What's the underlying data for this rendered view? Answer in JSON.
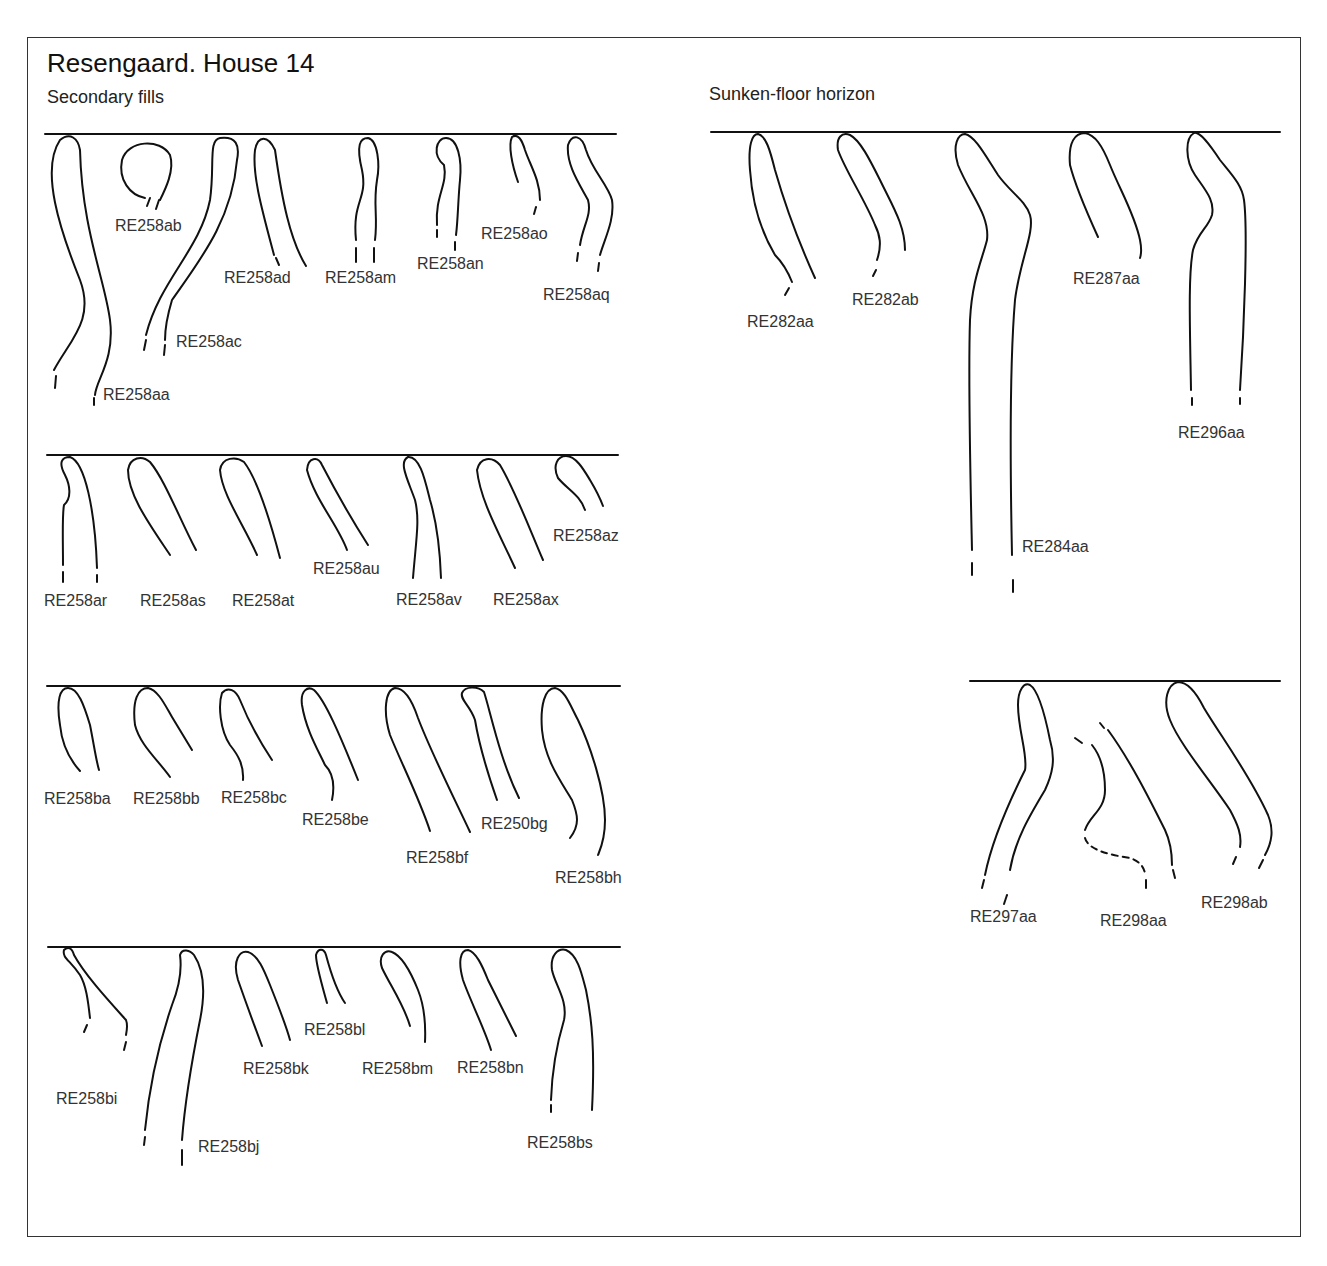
{
  "figure": {
    "title": "Resengaard. House 14",
    "left_panel_subtitle": "Secondary fills",
    "right_panel_subtitle": "Sunken-floor horizon"
  },
  "secondary_fills": {
    "row1": [
      "RE258aa",
      "RE258ab",
      "RE258ac",
      "RE258ad",
      "RE258am",
      "RE258an",
      "RE258ao",
      "RE258aq"
    ],
    "row2": [
      "RE258ar",
      "RE258as",
      "RE258at",
      "RE258au",
      "RE258av",
      "RE258ax",
      "RE258az"
    ],
    "row3": [
      "RE258ba",
      "RE258bb",
      "RE258bc",
      "RE258be",
      "RE258bf",
      "RE258bg",
      "RE258bh"
    ],
    "row4": [
      "RE258bi",
      "RE258bj",
      "RE258bk",
      "RE258bl",
      "RE258bm",
      "RE258bn",
      "RE258bs"
    ]
  },
  "sunken_floor": {
    "row1": [
      "RE282aa",
      "RE282ab",
      "RE284aa",
      "RE287aa",
      "RE296aa"
    ],
    "row2": [
      "RE297aa",
      "RE298aa",
      "RE298ab"
    ]
  },
  "labels_as_printed": {
    "RE258be": "RE258be",
    "RE258bg": "RE250bg"
  }
}
